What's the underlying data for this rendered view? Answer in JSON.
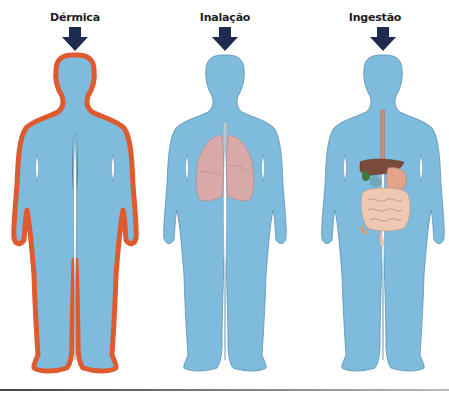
{
  "figure": {
    "routes": [
      {
        "id": "dermal",
        "label": "Dérmica",
        "highlight": "skin-outline"
      },
      {
        "id": "inhalation",
        "label": "Inalação",
        "highlight": "lungs"
      },
      {
        "id": "ingestion",
        "label": "Ingestão",
        "highlight": "digestive-tract"
      }
    ],
    "colors": {
      "body": "#7fbbdc",
      "body_outline": "#5a8fb0",
      "skin_highlight": "#e05a30",
      "arrow": "#1d2b4f",
      "lungs": "#d9a8a8",
      "digestive": "#e6b7a0",
      "liver": "#7a4a3a",
      "gallbladder": "#3f7a3a"
    }
  }
}
